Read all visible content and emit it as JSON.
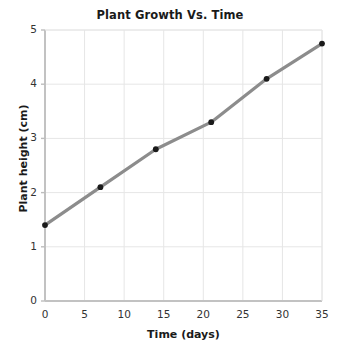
{
  "chart_data": {
    "type": "line",
    "title": "Plant Growth Vs. Time",
    "xlabel": "Time (days)",
    "ylabel": "Plant height (cm)",
    "x": [
      0,
      7,
      14,
      21,
      28,
      35
    ],
    "values": [
      1.4,
      2.1,
      2.8,
      3.3,
      4.1,
      4.75
    ],
    "series": [
      {
        "name": "Plant height",
        "x": [
          0,
          7,
          14,
          21,
          28,
          35
        ],
        "values": [
          1.4,
          2.1,
          2.8,
          3.3,
          4.1,
          4.75
        ]
      }
    ],
    "xlim": [
      0,
      35
    ],
    "ylim": [
      0,
      5
    ],
    "xticks": [
      0,
      5,
      10,
      15,
      20,
      25,
      30,
      35
    ],
    "yticks": [
      0,
      1,
      2,
      3,
      4,
      5
    ],
    "xtick_labels": [
      "0",
      "5",
      "10",
      "15",
      "20",
      "25",
      "30",
      "35"
    ],
    "ytick_labels": [
      "0",
      "1",
      "2",
      "3",
      "4",
      "5"
    ],
    "grid": true,
    "legend": false,
    "legend_position": "none",
    "marker": "circle",
    "line_color": "#8c8c8c",
    "marker_color": "#1a1a1a",
    "grid_color": "#e6e6e6",
    "axis_color": "#c9c9c9",
    "background_color": "#ffffff",
    "annotations": []
  }
}
